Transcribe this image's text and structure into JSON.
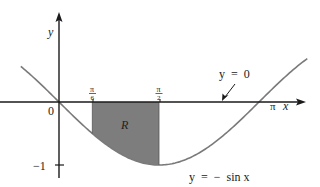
{
  "figure": {
    "axes": {
      "x_label": "x",
      "y_label": "y",
      "origin_label": "0",
      "x_ticks": [
        {
          "id": "pi6",
          "num": "π",
          "den": "6",
          "value_rad": 0.5236
        },
        {
          "id": "pi2",
          "num": "π",
          "den": "2",
          "value_rad": 1.5708
        }
      ],
      "x_end_label": "π",
      "y_tick_label": "−1"
    },
    "curve": {
      "equation_label": "y  =  −  sin x",
      "function": "-sin(x)",
      "x_range_rad": [
        -0.6,
        3.9
      ],
      "stroke_color": "#7a7a7a"
    },
    "line": {
      "equation_label": "y  =  0"
    },
    "region": {
      "label": "R",
      "x_from_rad": 0.5236,
      "x_to_rad": 1.5708,
      "fill_color": "#7d7d7d"
    },
    "colors": {
      "axis": "#1a1a1a",
      "text": "#222222",
      "background": "#ffffff"
    }
  }
}
